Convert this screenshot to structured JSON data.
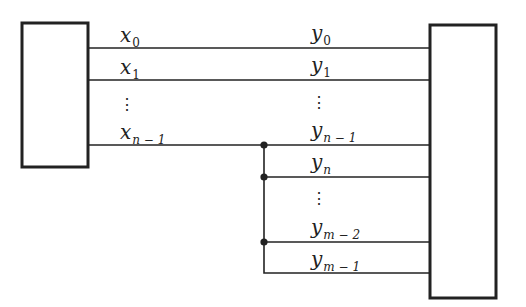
{
  "diagram": {
    "type": "block-wiring",
    "colors": {
      "stroke": "#222222",
      "background": "#ffffff"
    },
    "left_block": {
      "label": ""
    },
    "right_block": {
      "label": ""
    },
    "left_labels": [
      {
        "base": "x",
        "sub": "0"
      },
      {
        "base": "x",
        "sub": "1"
      },
      {
        "base": "x",
        "sub": "n − 1"
      }
    ],
    "right_labels": [
      {
        "base": "y",
        "sub": "0"
      },
      {
        "base": "y",
        "sub": "1"
      },
      {
        "base": "y",
        "sub": "n − 1"
      },
      {
        "base": "y",
        "sub": "n"
      },
      {
        "base": "y",
        "sub": "m − 2"
      },
      {
        "base": "y",
        "sub": "m − 1"
      }
    ],
    "ellipsis": "⋮",
    "junction_count": 3
  }
}
